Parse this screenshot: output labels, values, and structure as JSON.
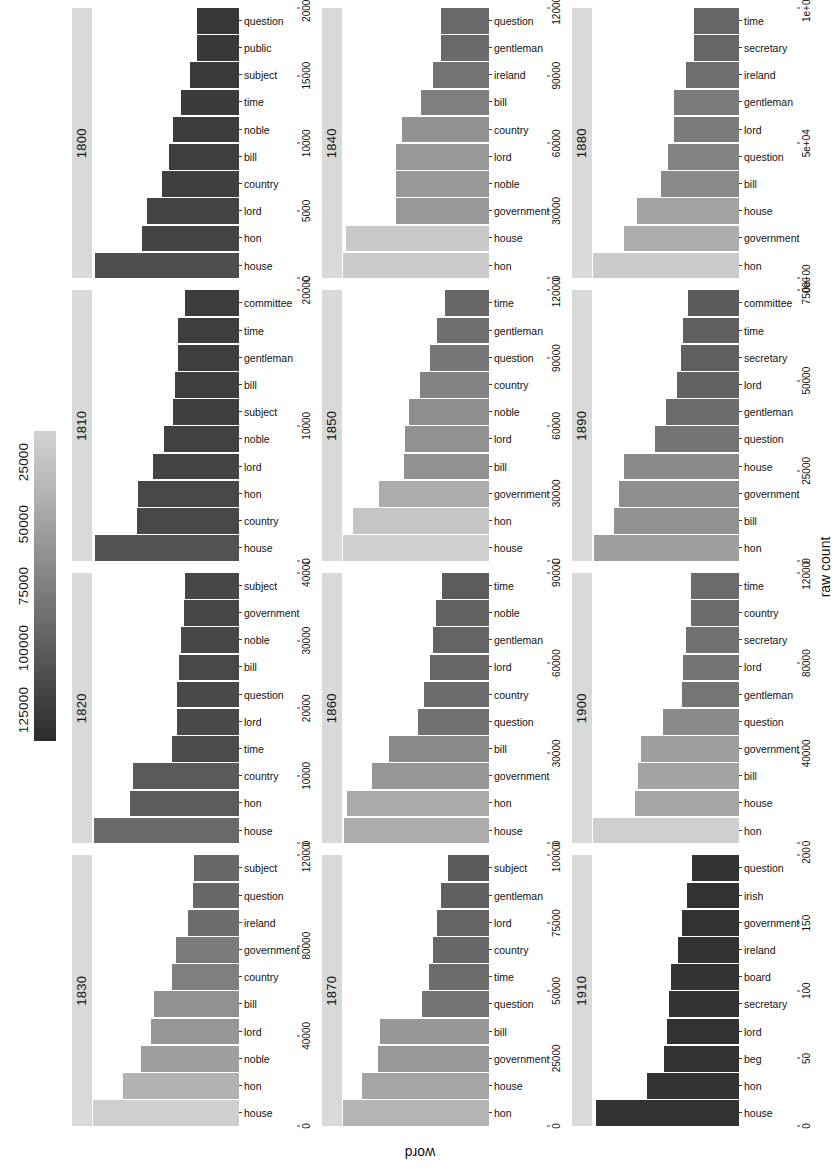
{
  "figure": {
    "xlabel": "raw count",
    "ylabel": "word"
  },
  "legend": {
    "title": "",
    "ticks": [
      "125000",
      "100000",
      "75000",
      "50000",
      "25000"
    ],
    "gradient_light": "#d2d2d2",
    "gradient_dark": "#2b2b2b"
  },
  "chart_data": {
    "type": "bar",
    "title": "",
    "xlabel": "raw count",
    "ylabel": "word",
    "orientation": "horizontal-facets",
    "grid": false,
    "legend_position": "top",
    "colorbar": {
      "label": "raw count",
      "ticks": [
        125000,
        100000,
        75000,
        50000,
        25000
      ],
      "low_color": "#2b2b2b",
      "high_color": "#d2d2d2"
    },
    "facets": [
      {
        "decade": "1800",
        "axis_ticks": [
          "0",
          "5000",
          "10000",
          "15000",
          "20000"
        ],
        "ylim": [
          0,
          21500
        ],
        "categories": [
          "house",
          "hon",
          "lord",
          "country",
          "bill",
          "noble",
          "time",
          "subject",
          "public",
          "question"
        ],
        "values": [
          21000,
          14200,
          13400,
          11300,
          10200,
          9700,
          8500,
          7200,
          6200,
          6100
        ]
      },
      {
        "decade": "1810",
        "axis_ticks": [
          "0",
          "10000",
          "20000"
        ],
        "ylim": [
          0,
          24000
        ],
        "categories": [
          "house",
          "country",
          "hon",
          "lord",
          "noble",
          "subject",
          "bill",
          "gentleman",
          "time",
          "committee"
        ],
        "values": [
          23500,
          16600,
          16500,
          14000,
          12200,
          10800,
          10400,
          10000,
          9900,
          8800
        ]
      },
      {
        "decade": "1820",
        "axis_ticks": [
          "0",
          "10000",
          "20000",
          "30000",
          "40000"
        ],
        "ylim": [
          0,
          41000
        ],
        "categories": [
          "house",
          "hon",
          "country",
          "time",
          "lord",
          "question",
          "bill",
          "noble",
          "government",
          "subject"
        ],
        "values": [
          40500,
          30500,
          29500,
          18800,
          17400,
          17300,
          16600,
          16100,
          15300,
          15200
        ]
      },
      {
        "decade": "1830",
        "axis_ticks": [
          "0",
          "40000",
          "80000",
          "120000"
        ],
        "ylim": [
          0,
          128000
        ],
        "categories": [
          "house",
          "hon",
          "noble",
          "lord",
          "bill",
          "country",
          "government",
          "ireland",
          "question",
          "subject"
        ],
        "values": [
          127000,
          101000,
          85000,
          77000,
          74000,
          58000,
          55000,
          44000,
          40000,
          39500
        ]
      },
      {
        "decade": "1840",
        "axis_ticks": [
          "0",
          "30000",
          "60000",
          "90000",
          "120000"
        ],
        "ylim": [
          0,
          125000
        ],
        "categories": [
          "hon",
          "house",
          "government",
          "noble",
          "lord",
          "country",
          "bill",
          "ireland",
          "gentleman",
          "question"
        ],
        "values": [
          124000,
          122000,
          79000,
          79000,
          79000,
          74000,
          58000,
          48000,
          41000,
          41000
        ]
      },
      {
        "decade": "1850",
        "axis_ticks": [
          "0",
          "30000",
          "60000",
          "90000",
          "120000"
        ],
        "ylim": [
          0,
          128000
        ],
        "categories": [
          "house",
          "hon",
          "government",
          "bill",
          "lord",
          "noble",
          "country",
          "question",
          "gentleman",
          "time"
        ],
        "values": [
          127000,
          118000,
          96000,
          74000,
          73000,
          70000,
          60000,
          51000,
          45000,
          38000
        ]
      },
      {
        "decade": "1860",
        "axis_ticks": [
          "0",
          "30000",
          "60000",
          "90000"
        ],
        "ylim": [
          0,
          97000
        ],
        "categories": [
          "house",
          "hon",
          "government",
          "bill",
          "question",
          "country",
          "lord",
          "gentleman",
          "noble",
          "time"
        ],
        "values": [
          96000,
          94000,
          77000,
          66000,
          47000,
          43000,
          39000,
          37000,
          35000,
          31000
        ]
      },
      {
        "decade": "1870",
        "axis_ticks": [
          "0",
          "25000",
          "50000",
          "75000",
          "100000"
        ],
        "ylim": [
          0,
          105000
        ],
        "categories": [
          "hon",
          "house",
          "government",
          "bill",
          "question",
          "time",
          "country",
          "lord",
          "gentleman",
          "subject"
        ],
        "values": [
          104000,
          91000,
          79000,
          78000,
          48000,
          43000,
          40000,
          37000,
          34000,
          29000
        ]
      },
      {
        "decade": "1880",
        "axis_ticks": [
          "0e+00",
          "5e+04",
          "1e+05"
        ],
        "ylim": [
          0,
          125000
        ],
        "categories": [
          "hon",
          "government",
          "house",
          "bill",
          "question",
          "lord",
          "gentleman",
          "ireland",
          "secretary",
          "time"
        ],
        "values": [
          124000,
          98000,
          87000,
          66000,
          60000,
          55000,
          55000,
          45000,
          38000,
          38000
        ]
      },
      {
        "decade": "1890",
        "axis_ticks": [
          "0",
          "25000",
          "50000",
          "75000"
        ],
        "ylim": [
          0,
          86000
        ],
        "categories": [
          "hon",
          "bill",
          "government",
          "house",
          "question",
          "gentleman",
          "lord",
          "secretary",
          "time",
          "committee"
        ],
        "values": [
          85000,
          73000,
          70000,
          67000,
          49000,
          43000,
          36000,
          34000,
          33000,
          30000
        ]
      },
      {
        "decade": "1900",
        "axis_ticks": [
          "0",
          "40000",
          "80000",
          "120000"
        ],
        "ylim": [
          0,
          128000
        ],
        "categories": [
          "hon",
          "house",
          "bill",
          "government",
          "question",
          "gentleman",
          "lord",
          "secretary",
          "country",
          "time"
        ],
        "values": [
          127000,
          91000,
          88000,
          85000,
          66000,
          50000,
          49000,
          46000,
          42000,
          42000
        ]
      },
      {
        "decade": "1910",
        "axis_ticks": [
          "0",
          "50",
          "100",
          "150",
          "200"
        ],
        "ylim": [
          0,
          205000
        ],
        "categories": [
          "house",
          "hon",
          "beg",
          "lord",
          "secretary",
          "board",
          "ireland",
          "government",
          "irish",
          "question"
        ],
        "values": [
          200,
          128,
          105,
          100,
          98,
          95,
          85,
          80,
          73,
          65
        ],
        "value_scale_note": "values in raw counts (axis in units of 200)"
      }
    ]
  }
}
